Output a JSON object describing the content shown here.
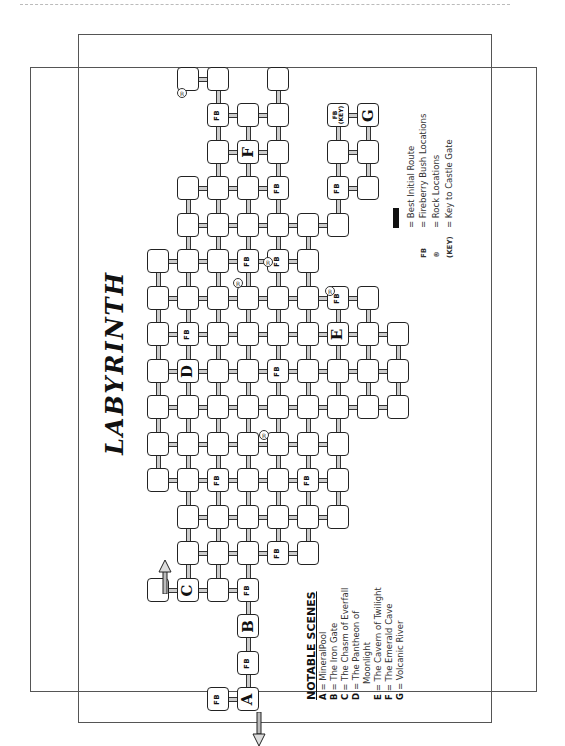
{
  "title": "LABYRINTH",
  "notable_scenes": {
    "heading": "NOTABLE SCENES",
    "items": [
      {
        "key": "A",
        "text": "= MineralPool"
      },
      {
        "key": "B",
        "text": "= The Iron Gate"
      },
      {
        "key": "C",
        "text": "= The Chasm of Everfall"
      },
      {
        "key": "D",
        "text": "= The Pantheon of"
      },
      {
        "key": "",
        "text": "Moonlight"
      },
      {
        "key": "E",
        "text": "= The Cavern of Twilight"
      },
      {
        "key": "F",
        "text": "= The Emerald Cave"
      },
      {
        "key": "G",
        "text": "= Volcanic River"
      }
    ]
  },
  "legend": {
    "items": [
      {
        "symbol": "best-route-bar",
        "key": "",
        "text": "= Best Initial Route"
      },
      {
        "symbol": "fb",
        "key": "FB",
        "text": "= Fireberry Bush Locations"
      },
      {
        "symbol": "rock",
        "key": "®",
        "text": "= Rock Locations"
      },
      {
        "symbol": "key",
        "key": "(KEY)",
        "text": "= Key to Castle Gate"
      }
    ]
  },
  "labels": {
    "fb": "FB",
    "key": "(KEY)",
    "rock": "R"
  },
  "map": {
    "rooms": [
      {
        "x": 188,
        "y": 79
      },
      {
        "x": 218,
        "y": 79
      },
      {
        "x": 278,
        "y": 79
      },
      {
        "x": 218,
        "y": 115,
        "label": "FB"
      },
      {
        "x": 248,
        "y": 115
      },
      {
        "x": 278,
        "y": 115
      },
      {
        "x": 338,
        "y": 115,
        "label": "FB(KEY)"
      },
      {
        "x": 368,
        "y": 115,
        "label": "G"
      },
      {
        "x": 218,
        "y": 152
      },
      {
        "x": 248,
        "y": 152,
        "label": "F"
      },
      {
        "x": 278,
        "y": 152
      },
      {
        "x": 338,
        "y": 152
      },
      {
        "x": 368,
        "y": 152
      },
      {
        "x": 188,
        "y": 188
      },
      {
        "x": 218,
        "y": 188
      },
      {
        "x": 248,
        "y": 188
      },
      {
        "x": 278,
        "y": 188,
        "label": "FB"
      },
      {
        "x": 338,
        "y": 188,
        "label": "FB"
      },
      {
        "x": 368,
        "y": 188
      },
      {
        "x": 188,
        "y": 225
      },
      {
        "x": 218,
        "y": 225
      },
      {
        "x": 248,
        "y": 225
      },
      {
        "x": 278,
        "y": 225
      },
      {
        "x": 308,
        "y": 225
      },
      {
        "x": 338,
        "y": 225
      },
      {
        "x": 158,
        "y": 261
      },
      {
        "x": 188,
        "y": 261
      },
      {
        "x": 218,
        "y": 261
      },
      {
        "x": 248,
        "y": 261,
        "label": "FB"
      },
      {
        "x": 278,
        "y": 261,
        "label": "FB"
      },
      {
        "x": 308,
        "y": 261
      },
      {
        "x": 158,
        "y": 298
      },
      {
        "x": 188,
        "y": 298
      },
      {
        "x": 218,
        "y": 298
      },
      {
        "x": 248,
        "y": 298
      },
      {
        "x": 278,
        "y": 298
      },
      {
        "x": 308,
        "y": 298
      },
      {
        "x": 338,
        "y": 298,
        "label": "FB"
      },
      {
        "x": 368,
        "y": 298
      },
      {
        "x": 158,
        "y": 334
      },
      {
        "x": 188,
        "y": 334,
        "label": "FB"
      },
      {
        "x": 218,
        "y": 334
      },
      {
        "x": 248,
        "y": 334
      },
      {
        "x": 278,
        "y": 334
      },
      {
        "x": 308,
        "y": 334
      },
      {
        "x": 338,
        "y": 334,
        "label": "E"
      },
      {
        "x": 368,
        "y": 334
      },
      {
        "x": 398,
        "y": 334
      },
      {
        "x": 158,
        "y": 371
      },
      {
        "x": 188,
        "y": 371,
        "label": "D"
      },
      {
        "x": 218,
        "y": 371
      },
      {
        "x": 248,
        "y": 371
      },
      {
        "x": 278,
        "y": 371,
        "label": "FB"
      },
      {
        "x": 308,
        "y": 371
      },
      {
        "x": 338,
        "y": 371
      },
      {
        "x": 368,
        "y": 371
      },
      {
        "x": 398,
        "y": 371
      },
      {
        "x": 158,
        "y": 407
      },
      {
        "x": 188,
        "y": 407
      },
      {
        "x": 218,
        "y": 407
      },
      {
        "x": 248,
        "y": 407
      },
      {
        "x": 278,
        "y": 407
      },
      {
        "x": 308,
        "y": 407
      },
      {
        "x": 338,
        "y": 407
      },
      {
        "x": 368,
        "y": 407
      },
      {
        "x": 398,
        "y": 407
      },
      {
        "x": 158,
        "y": 444
      },
      {
        "x": 188,
        "y": 444
      },
      {
        "x": 218,
        "y": 444
      },
      {
        "x": 248,
        "y": 444
      },
      {
        "x": 278,
        "y": 444
      },
      {
        "x": 308,
        "y": 444
      },
      {
        "x": 338,
        "y": 444
      },
      {
        "x": 158,
        "y": 480
      },
      {
        "x": 188,
        "y": 480
      },
      {
        "x": 218,
        "y": 480,
        "label": "FB"
      },
      {
        "x": 248,
        "y": 480
      },
      {
        "x": 278,
        "y": 480
      },
      {
        "x": 308,
        "y": 480,
        "label": "FB"
      },
      {
        "x": 338,
        "y": 480
      },
      {
        "x": 188,
        "y": 517
      },
      {
        "x": 218,
        "y": 517
      },
      {
        "x": 248,
        "y": 517
      },
      {
        "x": 278,
        "y": 517
      },
      {
        "x": 308,
        "y": 517
      },
      {
        "x": 338,
        "y": 517
      },
      {
        "x": 188,
        "y": 553
      },
      {
        "x": 218,
        "y": 553
      },
      {
        "x": 248,
        "y": 553
      },
      {
        "x": 278,
        "y": 553,
        "label": "FB"
      },
      {
        "x": 308,
        "y": 553
      },
      {
        "x": 158,
        "y": 590
      },
      {
        "x": 188,
        "y": 590,
        "label": "C"
      },
      {
        "x": 218,
        "y": 590
      },
      {
        "x": 248,
        "y": 590,
        "label": "FB"
      },
      {
        "x": 248,
        "y": 626,
        "label": "B"
      },
      {
        "x": 248,
        "y": 663,
        "label": "FB"
      },
      {
        "x": 218,
        "y": 699,
        "label": "FB"
      },
      {
        "x": 248,
        "y": 699,
        "label": "A"
      }
    ],
    "rocks": [
      {
        "x": 182,
        "y": 93
      },
      {
        "x": 238,
        "y": 283
      },
      {
        "x": 268,
        "y": 262
      },
      {
        "x": 330,
        "y": 291
      },
      {
        "x": 264,
        "y": 435
      }
    ]
  }
}
